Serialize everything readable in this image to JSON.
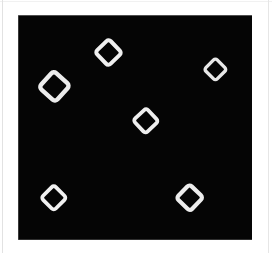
{
  "image": {
    "title": "Hollow diamond markers on black field",
    "background_color": "#ffffff",
    "canvas_color": "#050505",
    "marker_color": "#f2f2f2",
    "frame_color": "#e2e2e2",
    "canvas": {
      "x": 18,
      "y": 15,
      "width": 234,
      "height": 225
    },
    "marker_count": 6,
    "marker_shape": "hollow-diamond-outline"
  },
  "markers": [
    {
      "id": "marker-top-center",
      "label": "diamond-1",
      "cx": 108,
      "cy": 52,
      "size": 19,
      "stroke": 4.0,
      "rotation": 46,
      "color": "#f0f0f0"
    },
    {
      "id": "marker-upper-left",
      "label": "diamond-2",
      "cx": 54,
      "cy": 86,
      "size": 22,
      "stroke": 4.4,
      "rotation": 42,
      "color": "#ececec"
    },
    {
      "id": "marker-upper-right",
      "label": "diamond-3",
      "cx": 215,
      "cy": 69,
      "size": 16,
      "stroke": 3.4,
      "rotation": 45,
      "color": "#e8e8e8"
    },
    {
      "id": "marker-center",
      "label": "diamond-4",
      "cx": 146,
      "cy": 121,
      "size": 18,
      "stroke": 3.8,
      "rotation": 47,
      "color": "#efefef"
    },
    {
      "id": "marker-lower-left",
      "label": "diamond-5",
      "cx": 54,
      "cy": 198,
      "size": 18,
      "stroke": 3.8,
      "rotation": 45,
      "color": "#f2f2f2"
    },
    {
      "id": "marker-lower-right",
      "label": "diamond-6",
      "cx": 190,
      "cy": 198,
      "size": 19,
      "stroke": 4.2,
      "rotation": 44,
      "color": "#ededed"
    }
  ]
}
